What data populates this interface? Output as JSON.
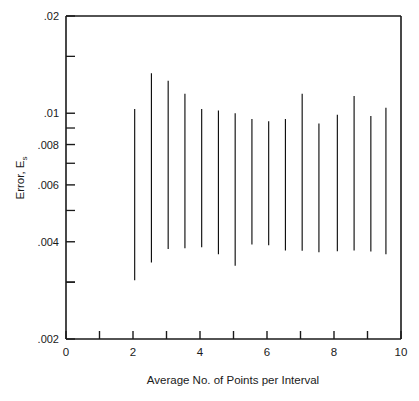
{
  "chart_data": {
    "type": "bar",
    "title": "",
    "subtitle": "",
    "xlabel": "Average No. of Points per Interval",
    "ylabel": "Error, E",
    "ylabel_subscript": "s",
    "yscale": "log",
    "xscale": "linear",
    "xlim": [
      0,
      10
    ],
    "ylim": [
      0.002,
      0.02
    ],
    "grid": false,
    "legend": null,
    "xticks": [
      0,
      1,
      2,
      3,
      4,
      5,
      6,
      7,
      8,
      9,
      10
    ],
    "xtick_labels": [
      "0",
      "",
      "2",
      "",
      "4",
      "",
      "6",
      "",
      "8",
      "",
      "10"
    ],
    "yticks": [
      0.002,
      0.003,
      0.004,
      0.006,
      0.008,
      0.01,
      0.02
    ],
    "ytick_labels": [
      ".002",
      "",
      ".004",
      ".006",
      ".008",
      ".01",
      ".02"
    ],
    "ytick_minor": [
      0.003,
      0.005,
      0.007,
      0.009,
      0.015
    ],
    "series_name": "Error range",
    "series": [
      {
        "x": 2.05,
        "low": 0.00304,
        "high": 0.0103
      },
      {
        "x": 2.55,
        "low": 0.00345,
        "high": 0.0133
      },
      {
        "x": 3.05,
        "low": 0.0038,
        "high": 0.0126
      },
      {
        "x": 3.55,
        "low": 0.00382,
        "high": 0.0115
      },
      {
        "x": 4.05,
        "low": 0.00385,
        "high": 0.0103
      },
      {
        "x": 4.55,
        "low": 0.00366,
        "high": 0.0102
      },
      {
        "x": 5.05,
        "low": 0.00337,
        "high": 0.01
      },
      {
        "x": 5.55,
        "low": 0.00392,
        "high": 0.0096
      },
      {
        "x": 6.05,
        "low": 0.0039,
        "high": 0.00945
      },
      {
        "x": 6.55,
        "low": 0.00376,
        "high": 0.0096
      },
      {
        "x": 7.05,
        "low": 0.00375,
        "high": 0.0115
      },
      {
        "x": 7.55,
        "low": 0.00371,
        "high": 0.0093
      },
      {
        "x": 8.1,
        "low": 0.00374,
        "high": 0.0099
      },
      {
        "x": 8.6,
        "low": 0.00376,
        "high": 0.0113
      },
      {
        "x": 9.1,
        "low": 0.00373,
        "high": 0.0098
      },
      {
        "x": 9.55,
        "low": 0.00366,
        "high": 0.0104
      }
    ]
  },
  "figure": {
    "axis_color": "#1a1a1a",
    "bar_color": "#101010",
    "background": "#ffffff"
  }
}
